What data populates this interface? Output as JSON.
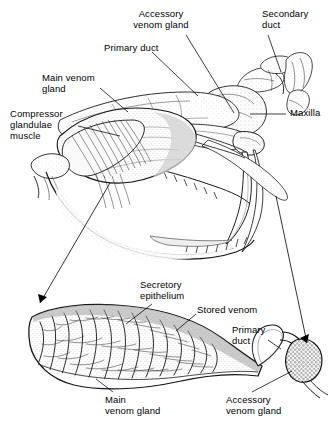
{
  "figure": {
    "background_color": "#ffffff",
    "ink_color": "#000000",
    "width": 335,
    "height": 440,
    "style": "black-and-white stippled line engraving"
  },
  "panels": [
    {
      "id": "upper",
      "name": "skull-lateral-view",
      "description": "Lateral view of viperid snake skull showing venom gland, compressor muscle, ducts, maxilla and fang"
    },
    {
      "id": "lower",
      "name": "venom-gland-enlarged-section",
      "description": "Enlarged longitudinal section of the main venom gland, primary duct and accessory venom gland"
    }
  ],
  "labels": [
    {
      "id": "accessory-venom-gland-top",
      "text": "Accessory\nvenom gland",
      "x": 152,
      "y": 10,
      "align": "center",
      "panel": "upper"
    },
    {
      "id": "secondary-duct",
      "text": "Secondary\nduct",
      "x": 262,
      "y": 10,
      "align": "left",
      "panel": "upper"
    },
    {
      "id": "primary-duct-top",
      "text": "Primary duct",
      "x": 104,
      "y": 44,
      "align": "left",
      "panel": "upper"
    },
    {
      "id": "main-venom-gland-top",
      "text": "Main venom\ngland",
      "x": 42,
      "y": 74,
      "align": "left",
      "panel": "upper"
    },
    {
      "id": "compressor-glandulae-muscle",
      "text": "Compressor\nglandulae\nmuscle",
      "x": 10,
      "y": 110,
      "align": "left",
      "panel": "upper"
    },
    {
      "id": "maxilla",
      "text": "Maxilla",
      "x": 290,
      "y": 111,
      "align": "left",
      "panel": "upper"
    },
    {
      "id": "secretory-epithelium",
      "text": "Secretory\nepithelium",
      "x": 140,
      "y": 281,
      "align": "left",
      "panel": "lower"
    },
    {
      "id": "stored-venom",
      "text": "Stored venom",
      "x": 197,
      "y": 306,
      "align": "left",
      "panel": "lower"
    },
    {
      "id": "primary-duct-lower",
      "text": "Primary\nduct",
      "x": 232,
      "y": 326,
      "align": "left",
      "panel": "lower"
    },
    {
      "id": "main-venom-gland-lower",
      "text": "Main\nvenom gland",
      "x": 105,
      "y": 396,
      "align": "left",
      "panel": "lower"
    },
    {
      "id": "accessory-venom-gland-lower",
      "text": "Accessory\nvenom gland",
      "x": 226,
      "y": 396,
      "align": "left",
      "panel": "lower"
    }
  ],
  "leader_lines": [
    {
      "id": "leader-accessory-venom-gland-top",
      "from": [
        186,
        35
      ],
      "to": [
        234,
        113
      ]
    },
    {
      "id": "leader-secondary-duct",
      "from": [
        268,
        35
      ],
      "to": [
        281,
        72
      ]
    },
    {
      "id": "leader-primary-duct-top",
      "from": [
        152,
        52
      ],
      "to": [
        196,
        95
      ]
    },
    {
      "id": "leader-main-venom-gland-top",
      "from": [
        100,
        88
      ],
      "to": [
        127,
        110
      ]
    },
    {
      "id": "leader-compressor-muscle",
      "from": [
        78,
        126
      ],
      "to": [
        118,
        135
      ]
    },
    {
      "id": "leader-maxilla",
      "from": [
        286,
        114
      ],
      "to": [
        250,
        114
      ]
    },
    {
      "id": "leader-secretory-epithelium",
      "from": [
        152,
        303
      ],
      "to": [
        125,
        322
      ]
    },
    {
      "id": "leader-stored-venom",
      "from": [
        196,
        313
      ],
      "to": [
        175,
        330
      ]
    },
    {
      "id": "leader-primary-duct-lower",
      "from": [
        267,
        339
      ],
      "to": [
        281,
        348
      ]
    },
    {
      "id": "leader-main-venom-gland-lower",
      "from": [
        113,
        392
      ],
      "to": [
        95,
        378
      ]
    },
    {
      "id": "leader-accessory-venom-gland-lower",
      "from": [
        252,
        392
      ],
      "to": [
        290,
        370
      ]
    }
  ],
  "magnification_arrows": [
    {
      "id": "arrow-gland-to-enlargement",
      "from": [
        108,
        185
      ],
      "to": [
        36,
        306
      ],
      "description": "arrow from main venom gland in skull to enlarged section"
    },
    {
      "id": "arrow-accessory-to-enlargement",
      "from": [
        278,
        196
      ],
      "to": [
        305,
        345
      ],
      "description": "arrow from accessory gland region to enlarged accessory gland"
    }
  ],
  "anatomy_parts": [
    "Main venom gland",
    "Compressor glandulae muscle",
    "Primary duct",
    "Accessory venom gland",
    "Secondary duct",
    "Maxilla",
    "Fang",
    "Secretory epithelium",
    "Stored venom",
    "Lower jaw with teeth"
  ]
}
